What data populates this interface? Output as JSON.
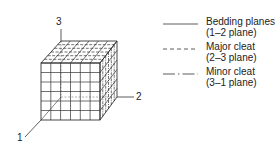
{
  "axes": {
    "axis1": "1",
    "axis2": "2",
    "axis3": "3"
  },
  "legend": [
    {
      "name": "Bedding planes",
      "plane": "(1–2 plane)",
      "line_style": "solid"
    },
    {
      "name": "Major cleat",
      "plane": "(2–3 plane)",
      "line_style": "dashed"
    },
    {
      "name": "Minor cleat",
      "plane": "(3–1 plane)",
      "line_style": "dash-dot"
    }
  ],
  "colors": {
    "line": "#333333",
    "background": "#ffffff"
  }
}
